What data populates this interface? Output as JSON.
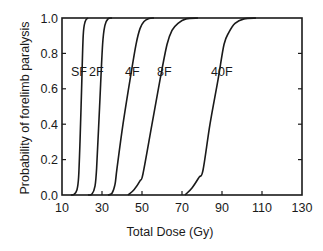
{
  "chart_data": {
    "type": "line",
    "title": "",
    "xlabel": "Total Dose (Gy)",
    "ylabel": "Probability of forelimb paralysis",
    "xlim": [
      10,
      130
    ],
    "ylim": [
      0.0,
      1.0
    ],
    "xticks": [
      "10",
      "30",
      "50",
      "70",
      "90",
      "110",
      "130"
    ],
    "yticks": [
      "0.0",
      "0.2",
      "0.4",
      "0.6",
      "0.8",
      "1.0"
    ],
    "grid": false,
    "legend": "inline labels",
    "series": [
      {
        "name": "SF",
        "label_x": 14.5,
        "label_y": 0.7,
        "points": [
          [
            14.5,
            0.0
          ],
          [
            16,
            0.003
          ],
          [
            17.5,
            0.03
          ],
          [
            18.3,
            0.1
          ],
          [
            19,
            0.3
          ],
          [
            19.8,
            0.6
          ],
          [
            20.6,
            0.9
          ],
          [
            21.6,
            0.98
          ],
          [
            23,
            1.0
          ]
        ]
      },
      {
        "name": "2F",
        "label_x": 23.5,
        "label_y": 0.7,
        "points": [
          [
            23,
            0.0
          ],
          [
            25,
            0.005
          ],
          [
            26.5,
            0.05
          ],
          [
            27.3,
            0.15
          ],
          [
            28.8,
            0.5
          ],
          [
            30.3,
            0.85
          ],
          [
            31.5,
            0.96
          ],
          [
            33,
            0.995
          ],
          [
            35,
            1.0
          ]
        ]
      },
      {
        "name": "4F",
        "label_x": 41.5,
        "label_y": 0.7,
        "points": [
          [
            33,
            0.0
          ],
          [
            35,
            0.01
          ],
          [
            36.5,
            0.06
          ],
          [
            37.5,
            0.15
          ],
          [
            40.5,
            0.4
          ],
          [
            44,
            0.65
          ],
          [
            47,
            0.85
          ],
          [
            49,
            0.94
          ],
          [
            51,
            0.98
          ],
          [
            53.5,
            0.997
          ],
          [
            56,
            1.0
          ]
        ]
      },
      {
        "name": "8F",
        "label_x": 57.5,
        "label_y": 0.7,
        "points": [
          [
            43,
            0.0
          ],
          [
            46,
            0.03
          ],
          [
            49,
            0.08
          ],
          [
            50.5,
            0.12
          ],
          [
            55,
            0.4
          ],
          [
            59,
            0.65
          ],
          [
            62.5,
            0.85
          ],
          [
            65,
            0.93
          ],
          [
            68,
            0.97
          ],
          [
            72,
            0.995
          ],
          [
            78,
            1.0
          ]
        ]
      },
      {
        "name": "40F",
        "label_x": 84.5,
        "label_y": 0.7,
        "points": [
          [
            71.5,
            0.0
          ],
          [
            75,
            0.04
          ],
          [
            78.5,
            0.1
          ],
          [
            80.5,
            0.14
          ],
          [
            84,
            0.4
          ],
          [
            88,
            0.65
          ],
          [
            91,
            0.85
          ],
          [
            93.5,
            0.92
          ],
          [
            96.5,
            0.97
          ],
          [
            101,
            0.995
          ],
          [
            107,
            1.0
          ]
        ]
      }
    ]
  },
  "plot": {
    "px_left": 62,
    "px_right": 302,
    "px_top": 18,
    "px_bottom": 195,
    "line_color": "#1a1a1a"
  }
}
